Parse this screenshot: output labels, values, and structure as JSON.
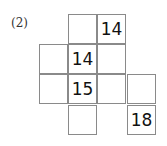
{
  "label": "(2)",
  "cells": [
    {
      "row": 0,
      "col": 1,
      "value": ""
    },
    {
      "row": 0,
      "col": 2,
      "value": "14"
    },
    {
      "row": 1,
      "col": 0,
      "value": ""
    },
    {
      "row": 1,
      "col": 1,
      "value": "14"
    },
    {
      "row": 1,
      "col": 2,
      "value": ""
    },
    {
      "row": 2,
      "col": 0,
      "value": ""
    },
    {
      "row": 2,
      "col": 1,
      "value": "15"
    },
    {
      "row": 2,
      "col": 2,
      "value": ""
    },
    {
      "row": 2,
      "col": 3,
      "value": ""
    },
    {
      "row": 3,
      "col": 1,
      "value": ""
    },
    {
      "row": 3,
      "col": 3,
      "value": "18"
    }
  ]
}
